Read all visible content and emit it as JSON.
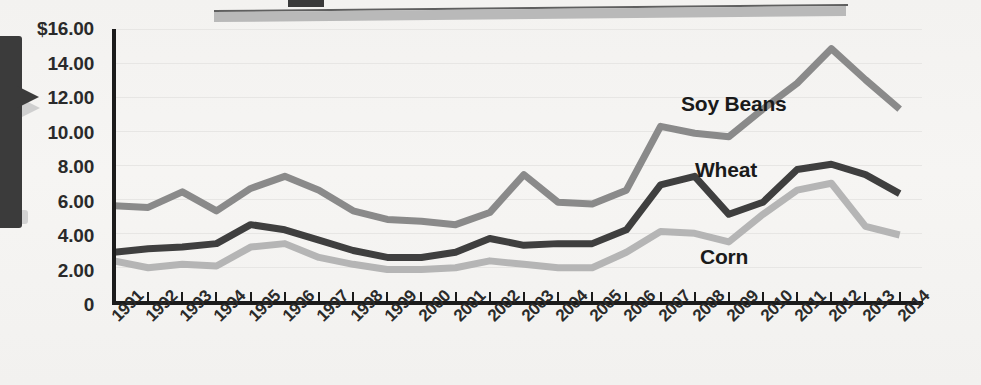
{
  "chart_data": {
    "type": "line",
    "title": "",
    "subtitle": "",
    "xlabel": "",
    "ylabel": "",
    "grid": true,
    "legend_position": "inline-annotations",
    "ylim": [
      0,
      16
    ],
    "xlim": [
      "1991",
      "2014"
    ],
    "y_ticks": [
      0,
      2,
      4,
      6,
      8,
      10,
      12,
      14,
      16
    ],
    "y_tick_labels": [
      "0",
      "2.00",
      "4.00",
      "6.00",
      "8.00",
      "10.00",
      "12.00",
      "14.00",
      "$16.00"
    ],
    "categories": [
      "1991",
      "1992",
      "1993",
      "1994",
      "1995",
      "1996",
      "1997",
      "1998",
      "1999",
      "2000",
      "2001",
      "2002",
      "2003",
      "2004",
      "2005",
      "2006",
      "2007",
      "2008",
      "2009",
      "2010",
      "2011",
      "2012",
      "2013",
      "2014"
    ],
    "series": [
      {
        "name": "Soy Beans",
        "color": "#8a8a8a",
        "values": [
          5.7,
          5.6,
          6.5,
          5.4,
          6.7,
          7.4,
          6.6,
          5.4,
          4.9,
          4.8,
          4.6,
          5.3,
          7.5,
          5.9,
          5.8,
          6.6,
          10.3,
          9.9,
          9.7,
          11.3,
          12.8,
          14.8,
          13.0,
          11.3
        ]
      },
      {
        "name": "Wheat",
        "color": "#3f3f3f",
        "values": [
          3.0,
          3.2,
          3.3,
          3.5,
          4.6,
          4.3,
          3.7,
          3.1,
          2.7,
          2.7,
          3.0,
          3.8,
          3.4,
          3.5,
          3.5,
          4.3,
          6.9,
          7.4,
          5.2,
          5.9,
          7.8,
          8.1,
          7.5,
          6.4
        ]
      },
      {
        "name": "Corn",
        "color": "#b5b5b5",
        "values": [
          2.5,
          2.1,
          2.3,
          2.2,
          3.3,
          3.5,
          2.7,
          2.3,
          2.0,
          2.0,
          2.1,
          2.5,
          2.3,
          2.1,
          2.1,
          3.0,
          4.2,
          4.1,
          3.6,
          5.2,
          6.6,
          7.0,
          4.5,
          4.0
        ]
      }
    ],
    "annotations": [
      {
        "text": "Soy Beans",
        "near_year": "2006"
      },
      {
        "text": "Wheat",
        "near_year": "2006"
      },
      {
        "text": "Corn",
        "near_year": "2008"
      }
    ]
  },
  "colors": {
    "background": "#f4f3f1",
    "axis": "#1b1b1b",
    "text": "#2a2a2a",
    "soy_beans": "#8a8a8a",
    "wheat": "#3f3f3f",
    "corn": "#b5b5b5",
    "banner": "#b9b9b9",
    "callout": "#3b3b3b"
  }
}
